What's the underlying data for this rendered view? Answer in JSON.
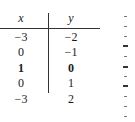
{
  "table": {
    "headers": {
      "x": "x",
      "y": "y"
    },
    "rows": [
      {
        "x": "−3",
        "y": "−2",
        "bold": false
      },
      {
        "x": "0",
        "y": "−1",
        "bold": false
      },
      {
        "x": "1",
        "y": "0",
        "bold": true
      },
      {
        "x": "0",
        "y": "1",
        "bold": false
      },
      {
        "x": "−3",
        "y": "2",
        "bold": false
      }
    ]
  }
}
